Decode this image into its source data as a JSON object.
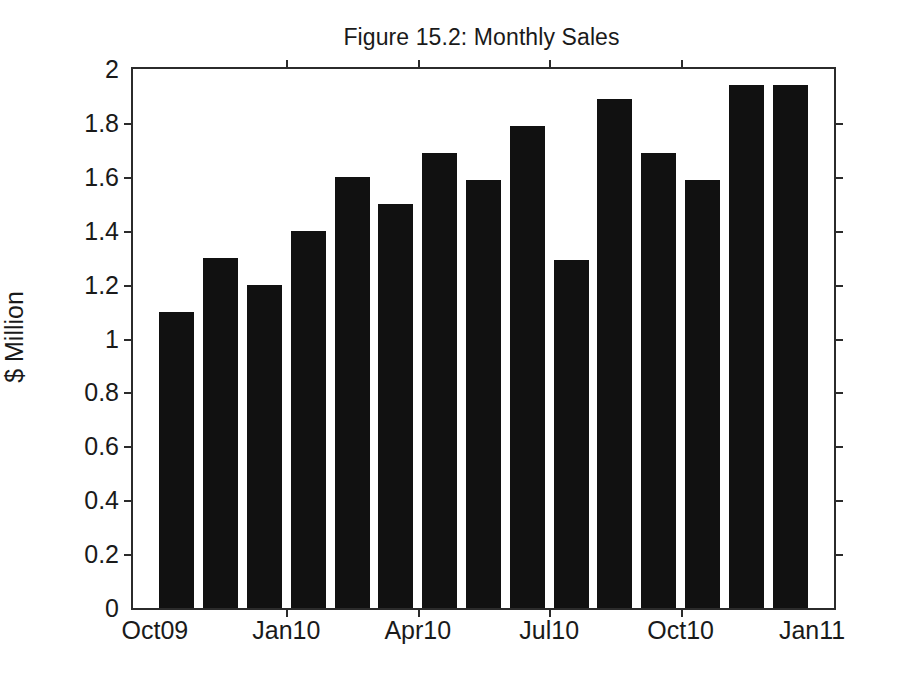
{
  "figure": {
    "title": "Figure 15.2: Monthly Sales",
    "y_axis_title": "$ Million",
    "x_axis_title": ""
  },
  "chart_data": {
    "type": "bar",
    "title": "Figure 15.2: Monthly Sales",
    "xlabel": "",
    "ylabel": "$ Million",
    "ylim": [
      0,
      2
    ],
    "yticks": [
      0,
      0.2,
      0.4,
      0.6,
      0.8,
      1,
      1.2,
      1.4,
      1.6,
      1.8,
      2
    ],
    "ytick_labels": [
      "0",
      "0.2",
      "0.4",
      "0.6",
      "0.8",
      "1",
      "1.2",
      "1.4",
      "1.6",
      "1.8",
      "2"
    ],
    "xtick_labels": [
      "Oct09",
      "Jan10",
      "Apr10",
      "Jul10",
      "Oct10",
      "Jan11"
    ],
    "xtick_positions": [
      0,
      3,
      6,
      9,
      12,
      15
    ],
    "grid": false,
    "legend": false,
    "bar_color": "#111111",
    "categories": [
      "Oct09",
      "Nov09",
      "Dec09",
      "Jan10",
      "Feb10",
      "Mar10",
      "Apr10",
      "May10",
      "Jun10",
      "Jul10",
      "Aug10",
      "Sep10",
      "Oct10",
      "Nov10",
      "Dec10"
    ],
    "values": [
      1.1,
      1.3,
      1.2,
      1.4,
      1.6,
      1.5,
      1.69,
      1.59,
      1.79,
      1.29,
      1.89,
      1.69,
      1.59,
      1.94,
      1.94
    ],
    "units": "$ Million"
  }
}
